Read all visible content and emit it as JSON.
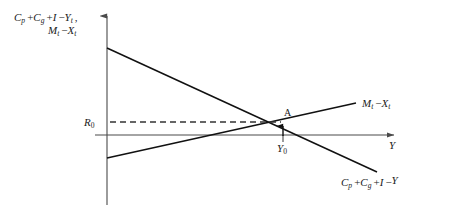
{
  "figure": {
    "type": "economics-diagram",
    "background_color": "#ffffff",
    "line_color": "#111111",
    "axis_color": "#4a4a4a"
  },
  "axes": {
    "y_axis": {
      "label_line1_terms": [
        "C",
        "p",
        "+",
        "C",
        "g",
        "+",
        "I",
        "−",
        "Y",
        "t"
      ],
      "label_line1": "Cₚ + C₉ + I − Yₜ",
      "label_line2": "Mₜ − Xₜ",
      "x_px": 107,
      "top_px": 10,
      "bottom_px": 205
    },
    "x_axis": {
      "label": "Y",
      "y_px": 135,
      "left_px": 95,
      "right_px": 400
    }
  },
  "curves": [
    {
      "name": "import-minus-export-line",
      "label": "Mₜ − Xₜ",
      "label_parts": {
        "m": "M",
        "m_sub": "t",
        "minus": "−",
        "x": "X",
        "x_sub": "t"
      },
      "slope": "upward",
      "start": {
        "x": 107,
        "y": 158
      },
      "end": {
        "x": 356,
        "y": 103
      },
      "label_pos": {
        "x": 362,
        "y": 106
      }
    },
    {
      "name": "absorption-gap-line",
      "label": "Cₚ + C₉ + I − Y",
      "label_parts": {
        "c1": "C",
        "c1_sub": "p",
        "plus1": "+",
        "c2": "C",
        "c2_sub": "g",
        "plus2": "+",
        "i": "I",
        "minus": "−",
        "y": "Y"
      },
      "slope": "downward",
      "start": {
        "x": 107,
        "y": 48
      },
      "end": {
        "x": 377,
        "y": 172
      },
      "label_pos": {
        "x": 343,
        "y": 185
      }
    }
  ],
  "reference_lines": [
    {
      "name": "r0-dashed-line",
      "label": "R",
      "label_sub": "0",
      "style": "dashed",
      "y_px": 122,
      "from_x": 110,
      "to_x": 283,
      "label_pos": {
        "x": 86,
        "y": 126
      }
    }
  ],
  "points": [
    {
      "name": "equilibrium-point-a",
      "label": "A",
      "x_px": 283,
      "y_px": 122,
      "label_pos": {
        "x": 286,
        "y": 116
      }
    }
  ],
  "annotations": [
    {
      "name": "y0-tick-label",
      "label": "Y",
      "label_sub": "0",
      "tick_x": 283,
      "label_pos": {
        "x": 278,
        "y": 150
      }
    },
    {
      "name": "vertical-pointer-arrow",
      "from": {
        "x": 283,
        "y": 135
      },
      "to": {
        "x": 283,
        "y": 123
      }
    }
  ]
}
